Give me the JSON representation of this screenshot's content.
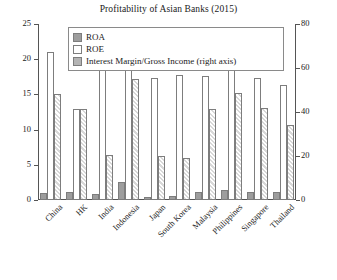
{
  "chart_data": {
    "type": "bar",
    "title": "Profitability of Asian Banks (2015)",
    "xlabel": "",
    "ylabel": "",
    "ylim": [
      0,
      25
    ],
    "y2lim": [
      0,
      80
    ],
    "yticks": [
      "0",
      "5",
      "10",
      "15",
      "20",
      "25"
    ],
    "y2ticks": [
      "0",
      "20",
      "40",
      "60",
      "80"
    ],
    "grid": false,
    "legend_position": "top-inside",
    "categories": [
      "China",
      "HK",
      "India",
      "Indonesia",
      "Japan",
      "South Korea",
      "Malaysia",
      "Philippines",
      "Singapore",
      "Thailand"
    ],
    "series": [
      {
        "name": "ROA",
        "axis": "left",
        "values": [
          1.0,
          1.1,
          0.9,
          2.5,
          0.4,
          0.6,
          1.2,
          1.4,
          1.1,
          1.2
        ]
      },
      {
        "name": "ROE",
        "axis": "left",
        "values": [
          21.0,
          12.9,
          19.2,
          20.0,
          0.0,
          0.0,
          0.0,
          19.6,
          0.0,
          0.0
        ]
      },
      {
        "name": "Interest Margin/Gross Income (right axis)",
        "axis": "right",
        "values": [
          15.0,
          13.0,
          6.4,
          17.2,
          6.3,
          5.9,
          13.0,
          15.2,
          13.1,
          10.6
        ]
      }
    ],
    "left_series_values": {
      "ROE": [
        21.0,
        12.9,
        19.2,
        20.0,
        17.3,
        17.8,
        17.6,
        19.6,
        17.4,
        16.4
      ],
      "ROA": [
        1.0,
        1.1,
        0.9,
        2.5,
        0.4,
        0.6,
        1.2,
        1.4,
        1.1,
        1.2
      ]
    },
    "right_series_values": {
      "InterestMargin": [
        48.0,
        41.5,
        20.5,
        55.0,
        20.2,
        19.0,
        41.5,
        48.5,
        42.0,
        34.0
      ]
    }
  },
  "legend": {
    "items": [
      {
        "label": "ROA",
        "swatch": "roa-swatch"
      },
      {
        "label": "ROE",
        "swatch": "roe-swatch"
      },
      {
        "label": "Interest Margin/Gross Income (right axis)",
        "swatch": "interest-margin-swatch"
      }
    ]
  },
  "colors": {
    "roa": "#9d9d9d",
    "roe": "#ffffff",
    "interest_margin": "#d8d8d8",
    "axis": "#555555",
    "text": "#1a1a1a"
  }
}
